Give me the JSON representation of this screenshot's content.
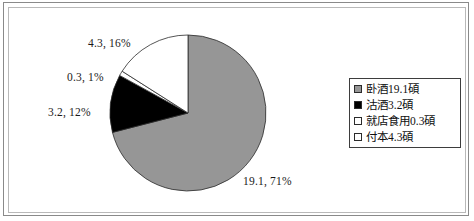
{
  "chart_data": {
    "type": "pie",
    "title": "",
    "subtitle": "",
    "xlabel": "",
    "ylabel": "",
    "legend_position": "right",
    "grid": false,
    "start_angle_oclock": 12,
    "direction": "clockwise",
    "categories": [
      "卧酒19.1碩",
      "沽酒3.2碩",
      "就店食用0.3碩",
      "付本4.3碩"
    ],
    "values": [
      19.1,
      3.2,
      0.3,
      4.3
    ],
    "percents": [
      71,
      12,
      1,
      16
    ],
    "colors": [
      "#969696",
      "#000000",
      "#ffffff",
      "#ffffff"
    ],
    "slices": [
      {
        "name": "卧酒19.1碩",
        "value": 19.1,
        "percent": 71,
        "color": "#969696",
        "data_label": "19.1, 71%"
      },
      {
        "name": "沽酒3.2碩",
        "value": 3.2,
        "percent": 12,
        "color": "#000000",
        "data_label": "3.2, 12%"
      },
      {
        "name": "就店食用0.3碩",
        "value": 0.3,
        "percent": 1,
        "color": "#ffffff",
        "data_label": "0.3, 1%"
      },
      {
        "name": "付本4.3碩",
        "value": 4.3,
        "percent": 16,
        "color": "#ffffff",
        "data_label": "4.3, 16%"
      }
    ],
    "data_labels": [
      "4.3, 16%",
      "0.3, 1%",
      "3.2, 12%",
      "19.1, 71%"
    ]
  },
  "labels": {
    "top": "4.3, 16%",
    "upper_left": "0.3, 1%",
    "left": "3.2, 12%",
    "bottom_right": "19.1, 71%"
  },
  "legend": {
    "items": [
      {
        "label": "卧酒19.1碩",
        "color": "#969696"
      },
      {
        "label": "沽酒3.2碩",
        "color": "#000000"
      },
      {
        "label": "就店食用0.3碩",
        "color": "#ffffff"
      },
      {
        "label": "付本4.3碩",
        "color": "#ffffff"
      }
    ]
  }
}
